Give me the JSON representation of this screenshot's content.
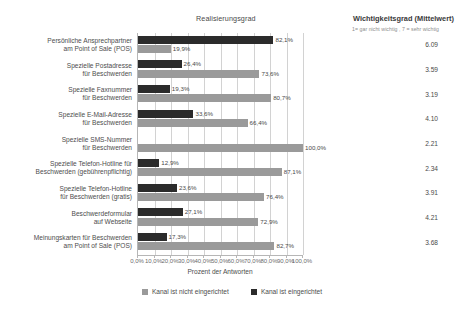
{
  "headers": {
    "realisierung": "Realisierungsgrad",
    "wichtigkeit": "Wichtigkeitsgrad (Mittelwert)",
    "wichtigkeit_scale": "1= gar nicht wichtig , 7 = sehr wichtig"
  },
  "legend": {
    "items": [
      {
        "label": "Kanal ist nicht eingerichtet",
        "color": "#9a9a9a"
      },
      {
        "label": "Kanal ist eingerichtet",
        "color": "#2b2b2b"
      }
    ]
  },
  "chart_data": {
    "type": "bar",
    "orientation": "horizontal",
    "title": "Realisierungsgrad",
    "xlabel": "Prozent der Antworten",
    "ylabel": "",
    "xlim": [
      0,
      100
    ],
    "grid": true,
    "legend_position": "bottom",
    "xticks": [
      "0,0%",
      "10,0%",
      "20,0%",
      "30,0%",
      "40,0%",
      "50,0%",
      "60,0%",
      "70,0%",
      "80,0%",
      "90,0%",
      "100,0%"
    ],
    "xtick_values": [
      0,
      10,
      20,
      30,
      40,
      50,
      60,
      70,
      80,
      90,
      100
    ],
    "categories": [
      "Persönliche Ansprechpartner\nam Point of Sale (POS)",
      "Spezielle Postadresse\nfür Beschwerden",
      "Spezielle Faxnummer\nfür Beschwerden",
      "Spezielle E-Mail-Adresse\nfür Beschwerden",
      "Spezielle SMS-Nummer\nfür Beschwerden",
      "Spezielle Telefon-Hotline für\nBeschwerden (gebührenpflichtig)",
      "Spezielle Telefon-Hotline\nfür Beschwerden (gratis)",
      "Beschwerdeformular\nauf Webseite",
      "Meinungskarten für Beschwerden\nam Point of Sale (POS)"
    ],
    "series": [
      {
        "name": "Kanal ist eingerichtet",
        "color": "#2b2b2b",
        "values": [
          82.1,
          26.4,
          19.3,
          33.6,
          0.0,
          12.9,
          23.6,
          27.1,
          17.3
        ],
        "labels": [
          "82,1%",
          "26,4%",
          "19,3%",
          "33,6%",
          "",
          "12,9%",
          "23,6%",
          "27,1%",
          "17,3%"
        ]
      },
      {
        "name": "Kanal ist nicht eingerichtet",
        "color": "#9a9a9a",
        "values": [
          19.9,
          73.6,
          80.7,
          66.4,
          100.0,
          87.1,
          76.4,
          72.9,
          82.7
        ],
        "labels": [
          "19,9%",
          "73,6%",
          "80,7%",
          "66,4%",
          "100,0%",
          "87,1%",
          "76,4%",
          "72,9%",
          "82,7%"
        ]
      }
    ],
    "secondary_column": {
      "title": "Wichtigkeitsgrad (Mittelwert)",
      "subtitle": "1= gar nicht wichtig , 7 = sehr wichtig",
      "values": [
        "6.09",
        "3.59",
        "3.19",
        "4.10",
        "2.21",
        "2.34",
        "3.91",
        "4.21",
        "3.68"
      ]
    }
  }
}
